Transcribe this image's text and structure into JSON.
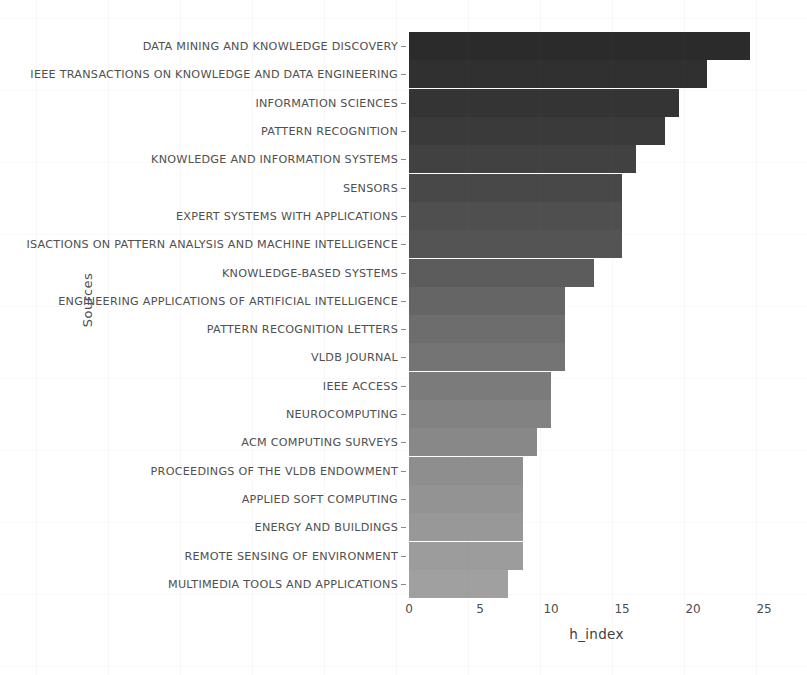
{
  "chart_data": {
    "type": "bar",
    "orientation": "horizontal",
    "title": "",
    "xlabel": "h_index",
    "ylabel": "Sources",
    "xlim": [
      0,
      26.4
    ],
    "xticks": [
      0,
      5,
      10,
      15,
      20,
      25
    ],
    "xtick_labels": [
      "0",
      "5",
      "10",
      "15",
      "20",
      "25"
    ],
    "grid": false,
    "legend": null,
    "categories": [
      "DATA MINING AND KNOWLEDGE DISCOVERY",
      "IEEE TRANSACTIONS ON KNOWLEDGE AND DATA ENGINEERING",
      "INFORMATION SCIENCES",
      "PATTERN RECOGNITION",
      "KNOWLEDGE AND INFORMATION SYSTEMS",
      "SENSORS",
      "EXPERT SYSTEMS WITH APPLICATIONS",
      "ISACTIONS ON PATTERN ANALYSIS AND MACHINE INTELLIGENCE",
      "KNOWLEDGE-BASED SYSTEMS",
      "ENGINEERING APPLICATIONS OF ARTIFICIAL INTELLIGENCE",
      "PATTERN RECOGNITION LETTERS",
      "VLDB JOURNAL",
      "IEEE ACCESS",
      "NEUROCOMPUTING",
      "ACM COMPUTING SURVEYS",
      "PROCEEDINGS OF THE VLDB ENDOWMENT",
      "APPLIED SOFT COMPUTING",
      "ENERGY AND BUILDINGS",
      "REMOTE SENSING OF ENVIRONMENT",
      "MULTIMEDIA TOOLS AND APPLICATIONS"
    ],
    "values": [
      24,
      21,
      19,
      18,
      16,
      15,
      15,
      15,
      13,
      11,
      11,
      11,
      10,
      10,
      9,
      8,
      8,
      8,
      8,
      7
    ],
    "bar_colors": [
      "#2b2b2b",
      "#303030",
      "#343434",
      "#3a3a3a",
      "#414141",
      "#484848",
      "#4f4f4f",
      "#545454",
      "#5c5c5c",
      "#656565",
      "#6d6d6d",
      "#747474",
      "#7b7b7b",
      "#828282",
      "#888888",
      "#8e8e8e",
      "#939393",
      "#989898",
      "#9c9c9c",
      "#a0a0a0"
    ]
  },
  "axes": {
    "y_title": "Sources",
    "x_title": "h_index"
  }
}
